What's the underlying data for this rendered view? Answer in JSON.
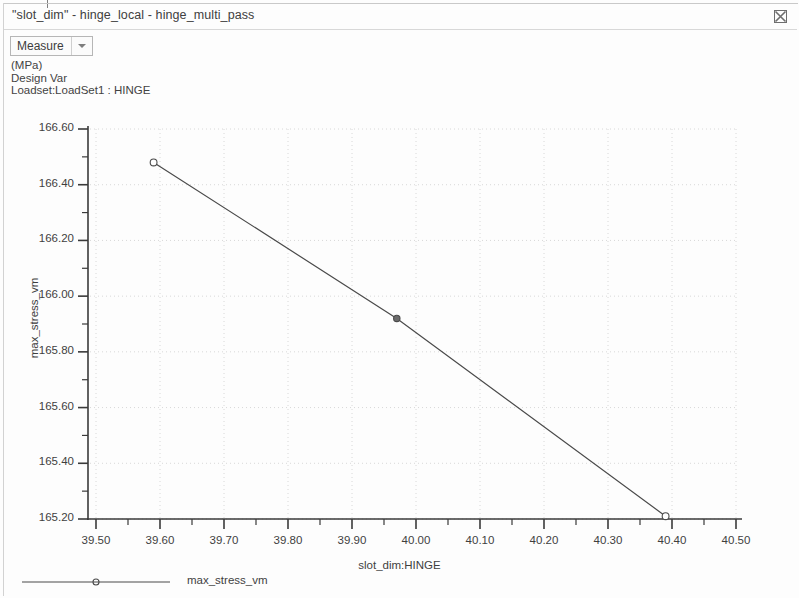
{
  "window": {
    "title": "\"slot_dim\" - hinge_local - hinge_multi_pass",
    "close_icon": "close-icon"
  },
  "toolbar": {
    "measure_label": "Measure",
    "caret_icon": "chevron-down-icon"
  },
  "header": {
    "line1": "(MPa)",
    "line2": "Design Var",
    "line3": "Loadset:LoadSet1 :  HINGE"
  },
  "colors": {
    "line": "#4a4a4a",
    "axis": "#3a3a3a",
    "grid": "#d8d8d8",
    "text": "#3f3f3f",
    "background": "#ffffff"
  },
  "chart_data": {
    "type": "line",
    "title": "",
    "subtitle": "",
    "xlabel": "slot_dim:HINGE",
    "ylabel": "max_stress_vm",
    "units": "(MPa)",
    "xlim": [
      39.45,
      40.5
    ],
    "ylim": [
      165.2,
      166.6
    ],
    "xticks": [
      "39.50",
      "39.60",
      "39.70",
      "39.80",
      "39.90",
      "40.00",
      "40.10",
      "40.20",
      "40.30",
      "40.40",
      "40.50"
    ],
    "xtick_values": [
      39.5,
      39.6,
      39.7,
      39.8,
      39.9,
      40.0,
      40.1,
      40.2,
      40.3,
      40.4,
      40.5
    ],
    "yticks": [
      "166.60",
      "166.40",
      "166.20",
      "166.00",
      "165.80",
      "165.60",
      "165.40",
      "165.20"
    ],
    "ytick_values": [
      166.6,
      166.4,
      166.2,
      166.0,
      165.8,
      165.6,
      165.4,
      165.2
    ],
    "minor_ticks_per_interval": 2,
    "grid": true,
    "legend_position": "bottom-left",
    "series": [
      {
        "name": "max_stress_vm",
        "marker": "circle",
        "x": [
          39.59,
          39.97,
          40.39
        ],
        "values": [
          166.48,
          165.92,
          165.21
        ],
        "marker_filled": [
          false,
          true,
          false
        ]
      }
    ]
  },
  "legend": {
    "entry_label": "max_stress_vm",
    "marker_icon": "circle-marker-icon"
  }
}
